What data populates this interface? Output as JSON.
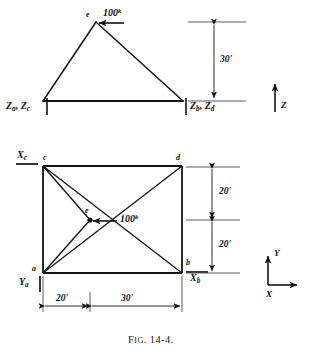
{
  "figure": {
    "caption_prefix": "F",
    "caption_smallcaps": "IG",
    "caption_number": ". 14-4.",
    "caption_full": "Fig. 14-4.",
    "line_color": "#141414",
    "background": "#ffffff"
  },
  "elevation_view": {
    "name": "elevation",
    "apex_node": "e",
    "force_label": "100",
    "force_unit_superscript": "k",
    "force_direction": "left",
    "height_dimension": "30'",
    "left_support_label": "Z",
    "left_support_sub_1": "a",
    "left_support_sub_2": "c",
    "left_support_text": "Za, Zc",
    "right_support_label": "Z",
    "right_support_sub_1": "b",
    "right_support_sub_2": "d",
    "right_support_text": "Zb, Zd",
    "axis_label": "Z",
    "axis_direction": "up"
  },
  "plan_view": {
    "name": "plan",
    "nodes": [
      {
        "id": "c",
        "position": "top-left"
      },
      {
        "id": "d",
        "position": "top-right"
      },
      {
        "id": "a",
        "position": "bottom-left"
      },
      {
        "id": "b",
        "position": "bottom-right"
      },
      {
        "id": "e",
        "position": "center"
      }
    ],
    "force_label": "100",
    "force_unit_superscript": "k",
    "force_direction": "left",
    "reaction_xc": "X",
    "reaction_xc_sub": "c",
    "reaction_xc_text": "Xc",
    "reaction_xb": "X",
    "reaction_xb_sub": "b",
    "reaction_xb_text": "Xb",
    "reaction_ya": "Y",
    "reaction_ya_sub": "a",
    "reaction_ya_text": "Ya",
    "vertical_dim_top": "20'",
    "vertical_dim_bottom": "20'",
    "horizontal_dim_left": "20'",
    "horizontal_dim_right": "30'",
    "axis_y_label": "Y",
    "axis_x_label": "X"
  }
}
